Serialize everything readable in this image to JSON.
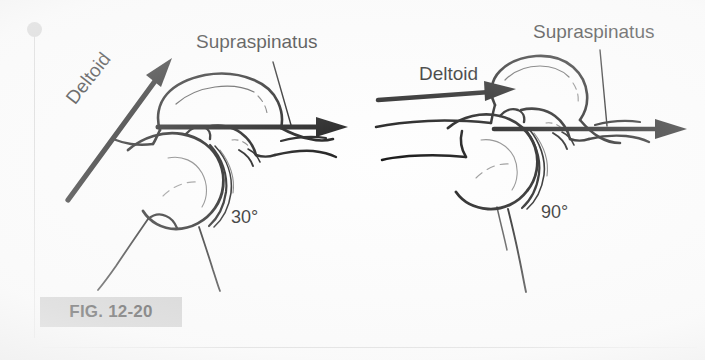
{
  "figure": {
    "caption": "FIG. 12-20",
    "caption_band_color": "#c8c8c8",
    "ink_color": "#1a1a1a",
    "background_color": "#fefefe"
  },
  "panels": [
    {
      "id": "left",
      "position": "left",
      "angle_label": "30°",
      "muscles": [
        {
          "name": "Deltoid",
          "label": "Deltoid",
          "vector": "oblique-superior",
          "orientation": "diagonal-up-right"
        },
        {
          "name": "Supraspinatus",
          "label": "Supraspinatus",
          "vector": "horizontal-medial-compression",
          "orientation": "horizontal-right"
        }
      ]
    },
    {
      "id": "right",
      "position": "right",
      "angle_label": "90°",
      "muscles": [
        {
          "name": "Deltoid",
          "label": "Deltoid",
          "vector": "horizontal-superior",
          "orientation": "horizontal-right"
        },
        {
          "name": "Supraspinatus",
          "label": "Supraspinatus",
          "vector": "horizontal-medial-compression",
          "orientation": "horizontal-right"
        }
      ]
    }
  ],
  "icons": {
    "margin_dot": "binding-hole-dot",
    "margin_rule": "page-margin-rule",
    "bottom_rule": "page-bottom-rule"
  }
}
